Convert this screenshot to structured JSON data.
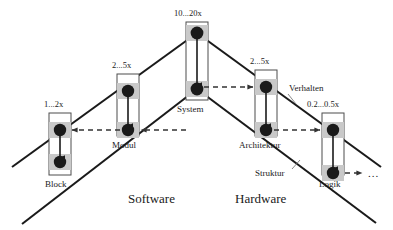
{
  "diagram": {
    "colors": {
      "line": "#1a1a1a",
      "dot": "#1a1a1a",
      "band": "#c9c9c9",
      "box_fill": "#ffffff",
      "box_stroke": "#4d4d4d",
      "dashed": "#555555",
      "text": "#1a1a1a"
    },
    "domains": [
      {
        "name": "software",
        "label": "Software",
        "x": 130,
        "y": 200
      },
      {
        "name": "hardware",
        "label": "Hardware",
        "x": 237,
        "y": 200
      }
    ],
    "edge_labels": [
      {
        "name": "verhalten",
        "label": "Verhalten",
        "x": 289,
        "y": 89
      },
      {
        "name": "struktur",
        "label": "Struktur",
        "x": 262,
        "y": 174
      }
    ],
    "ellipsis": {
      "label": "...",
      "x": 371,
      "y": 175
    },
    "nodes": [
      {
        "name": "block",
        "label": "Block",
        "ratio": "1...2x",
        "box_x": 49,
        "box_y": 113,
        "box_w": 22,
        "box_h": 62,
        "ratio_x": 44,
        "ratio_y": 103,
        "label_x": 46,
        "label_y": 186
      },
      {
        "name": "modul",
        "label": "Modul",
        "ratio": "2...5x",
        "box_x": 117,
        "box_y": 74,
        "box_w": 22,
        "box_h": 62,
        "ratio_x": 112,
        "ratio_y": 64,
        "label_x": 112,
        "label_y": 147
      },
      {
        "name": "system",
        "label": "System",
        "ratio": "10...20x",
        "box_x": 186,
        "box_y": 22,
        "box_w": 22,
        "box_h": 78,
        "ratio_x": 174,
        "ratio_y": 12,
        "label_x": 178,
        "label_y": 111
      },
      {
        "name": "architektur",
        "label": "Architektur",
        "ratio": "2...5x",
        "box_x": 255,
        "box_y": 70,
        "box_w": 22,
        "box_h": 66,
        "ratio_x": 250,
        "ratio_y": 60,
        "label_x": 240,
        "label_y": 147
      },
      {
        "name": "logik",
        "label": "Logik",
        "ratio": "0.2...0.5x",
        "box_x": 322,
        "box_y": 113,
        "box_w": 22,
        "box_h": 62,
        "ratio_x": 307,
        "ratio_y": 103,
        "label_x": 320,
        "label_y": 186
      }
    ],
    "dashed_arrows": [
      {
        "name": "modul-to-block",
        "x1": 128,
        "y1": 130,
        "x2": 74,
        "y2": 130
      },
      {
        "name": "system-to-modul",
        "x1": 185,
        "y1": 130,
        "x2": 141,
        "y2": 130
      },
      {
        "name": "system-to-architektur",
        "x1": 209,
        "y1": 87,
        "x2": 253,
        "y2": 87
      },
      {
        "name": "architektur-to-logik",
        "x1": 279,
        "y1": 130,
        "x2": 320,
        "y2": 130
      },
      {
        "name": "logik-to-next",
        "x1": 346,
        "y1": 173,
        "x2": 364,
        "y2": 173
      }
    ]
  }
}
